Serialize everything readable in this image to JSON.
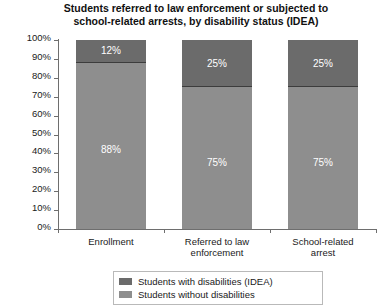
{
  "chart_data": {
    "type": "bar",
    "subtype": "stacked-percentage",
    "title": "Students referred to law enforcement or subjected to school-related arrests, by disability status (IDEA)",
    "title_lines": [
      "Students referred to law enforcement or subjected to",
      "school-related arrests, by disability status (IDEA)"
    ],
    "xlabel": "",
    "ylabel": "",
    "ylim": [
      0,
      100
    ],
    "yticks": [
      "0%",
      "10%",
      "20%",
      "30%",
      "40%",
      "50%",
      "60%",
      "70%",
      "80%",
      "90%",
      "100%"
    ],
    "ytick_values": [
      0,
      10,
      20,
      30,
      40,
      50,
      60,
      70,
      80,
      90,
      100
    ],
    "grid": false,
    "legend_position": "bottom",
    "categories": [
      "Enrollment",
      "Referred to law enforcement",
      "School-related arrest"
    ],
    "category_label_lines": [
      [
        "Enrollment"
      ],
      [
        "Referred to law",
        "enforcement"
      ],
      [
        "School-related",
        "arrest"
      ]
    ],
    "series": [
      {
        "name": "Students with disabilities (IDEA)",
        "color": "#6b6b6b",
        "values": [
          12,
          25,
          25
        ],
        "value_labels": [
          "12%",
          "25%",
          "25%"
        ]
      },
      {
        "name": "Students without disabilities",
        "color": "#8e8e8e",
        "values": [
          88,
          75,
          75
        ],
        "value_labels": [
          "88%",
          "75%",
          "75%"
        ]
      }
    ]
  },
  "legend": {
    "items": [
      {
        "label": "Students with disabilities (IDEA)",
        "color": "#6b6b6b"
      },
      {
        "label": "Students without disabilities",
        "color": "#8e8e8e"
      }
    ]
  }
}
